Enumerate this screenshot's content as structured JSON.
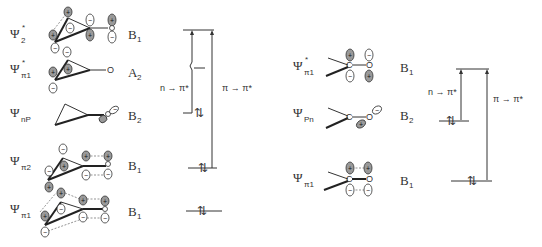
{
  "left_diagram": {
    "orbitals": [
      {
        "psi": "Ψ",
        "subscript": "2",
        "star": "*",
        "symmetry": "B",
        "symmetry_sub": "1"
      },
      {
        "psi": "Ψ",
        "subscript": "π1",
        "star": "*",
        "symmetry": "A",
        "symmetry_sub": "2"
      },
      {
        "psi": "Ψ",
        "subscript": "nP",
        "star": "",
        "symmetry": "B",
        "symmetry_sub": "2"
      },
      {
        "psi": "Ψ",
        "subscript": "π2",
        "star": "",
        "symmetry": "B",
        "symmetry_sub": "1"
      },
      {
        "psi": "Ψ",
        "subscript": "π1",
        "star": "",
        "symmetry": "B",
        "symmetry_sub": "1"
      }
    ],
    "atom_label": "O",
    "transitions": [
      {
        "label": "n → π*"
      },
      {
        "label": "π → π*"
      }
    ]
  },
  "right_diagram": {
    "orbitals": [
      {
        "psi": "Ψ",
        "subscript": "π1",
        "star": "*",
        "symmetry": "B",
        "symmetry_sub": "1"
      },
      {
        "psi": "Ψ",
        "subscript": "Pn",
        "star": "",
        "symmetry": "B",
        "symmetry_sub": "2"
      },
      {
        "psi": "Ψ",
        "subscript": "π1",
        "star": "",
        "symmetry": "B",
        "symmetry_sub": "1"
      }
    ],
    "atom_labels": {
      "carbon": "C",
      "oxygen": "O"
    },
    "transitions": [
      {
        "label": "n → π*"
      },
      {
        "label": "π → π*"
      }
    ]
  },
  "signs": {
    "plus": "+",
    "minus": "−"
  },
  "electron_pair": "⇅"
}
